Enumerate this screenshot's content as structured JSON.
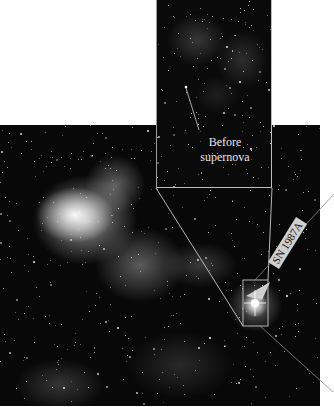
{
  "figure": {
    "inset": {
      "label_line1": "Before",
      "label_line2": "supernova"
    },
    "main": {
      "arrow_label": "SN 1987A"
    },
    "colors": {
      "background": "#ffffff",
      "sky": "#080808",
      "outline": "#bdbdbd"
    }
  }
}
